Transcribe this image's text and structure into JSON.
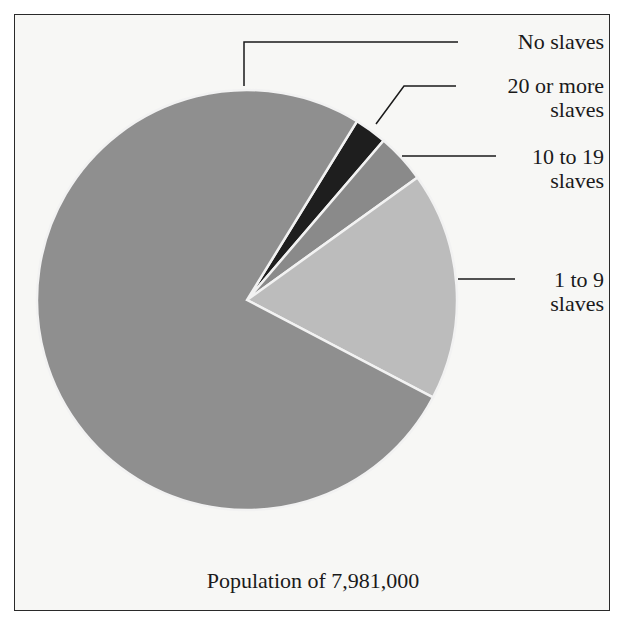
{
  "chart_data": {
    "type": "pie",
    "title": "",
    "caption": "Population of 7,981,000",
    "categories": [
      "No slaves",
      "20 or more slaves",
      "10 to 19 slaves",
      "1 to 9 slaves"
    ],
    "values": [
      76.1,
      2.5,
      3.8,
      17.6
    ],
    "units": "percent of population (estimated from slice angles)",
    "colors": [
      "#8f8f8f",
      "#1e1e1e",
      "#8a8a8a",
      "#bcbcbc"
    ],
    "start_angle_deg": 31.6,
    "direction": "clockwise",
    "legend": "callout labels with leader lines, right side"
  },
  "labels": {
    "no_slaves": "No slaves",
    "twenty_plus_l1": "20 or more",
    "twenty_plus_l2": "slaves",
    "ten_19_l1": "10 to 19",
    "ten_19_l2": "slaves",
    "one_9_l1": "1 to 9",
    "one_9_l2": "slaves"
  },
  "caption": "Population of 7,981,000"
}
